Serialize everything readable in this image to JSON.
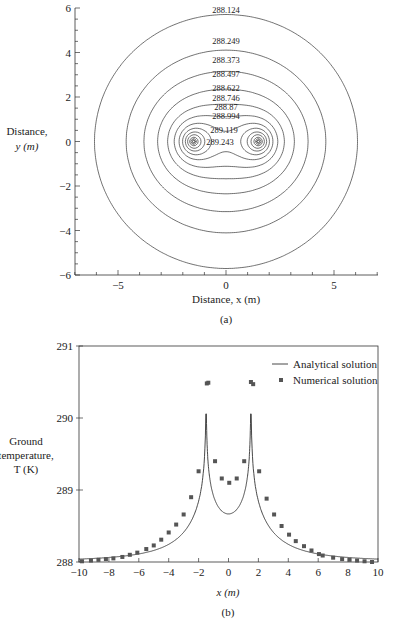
{
  "chart_data": [
    {
      "type": "contour",
      "caption": "(a)",
      "xlabel": "Distance, x (m)",
      "ylabel_line1": "Distance,",
      "ylabel_line2": "y (m)",
      "xlim": [
        -7,
        7
      ],
      "ylim": [
        -6,
        6
      ],
      "xticks": [
        -5,
        0,
        5
      ],
      "xtick_labels": [
        "−5",
        "0",
        "5"
      ],
      "yticks": [
        6,
        4,
        2,
        0,
        -2,
        -4,
        -6
      ],
      "ytick_labels": [
        "6",
        "4",
        "2",
        "0",
        "−2",
        "−4",
        "−6"
      ],
      "heat_sources_x": [
        -1.5,
        1.5
      ],
      "contour_levels": [
        288.124,
        288.249,
        288.373,
        288.497,
        288.622,
        288.746,
        288.87,
        288.994,
        289.119,
        289.243
      ],
      "contour_labels": [
        "288.124",
        "288.249",
        "288.373",
        "288.497",
        "288.622",
        "288.746",
        "288.87",
        "288.994",
        "289.119",
        "289.243"
      ]
    },
    {
      "type": "line",
      "caption": "(b)",
      "xlabel": "x (m)",
      "ylabel_line1": "Ground",
      "ylabel_line2": "temperature,",
      "ylabel_line3": "T (K)",
      "xlim": [
        -10,
        10
      ],
      "ylim": [
        288,
        291
      ],
      "xticks": [
        -10,
        -8,
        -6,
        -4,
        -2,
        0,
        2,
        4,
        6,
        8,
        10
      ],
      "xtick_labels": [
        "−10",
        "−8",
        "−6",
        "−4",
        "−2",
        "0",
        "2",
        "4",
        "6",
        "8",
        "10"
      ],
      "yticks": [
        288,
        289,
        290,
        291
      ],
      "ytick_labels": [
        "288",
        "289",
        "290",
        "291"
      ],
      "legend": {
        "position": "upper right",
        "entries": [
          "Analytical solution",
          "Numerical solution"
        ]
      },
      "series": [
        {
          "name": "Numerical solution",
          "marker": "square",
          "x": [
            -9.8,
            -9.2,
            -8.7,
            -8.2,
            -7.7,
            -7.1,
            -6.6,
            -6.1,
            -5.5,
            -5.0,
            -4.5,
            -4.0,
            -3.5,
            -3.0,
            -2.5,
            -2.0,
            -1.45,
            -1.35,
            -0.9,
            -0.45,
            0.05,
            0.55,
            1.05,
            1.5,
            1.65,
            2.05,
            2.55,
            3.05,
            3.55,
            4.05,
            4.5,
            5.05,
            5.55,
            6.05,
            6.3,
            7.0,
            7.6,
            8.1,
            8.6,
            9.1,
            9.6
          ],
          "y": [
            288.01,
            288.02,
            288.03,
            288.04,
            288.05,
            288.07,
            288.1,
            288.13,
            288.18,
            288.23,
            288.31,
            288.41,
            288.52,
            288.66,
            288.9,
            289.26,
            290.48,
            290.49,
            289.4,
            289.16,
            289.1,
            289.16,
            289.4,
            290.5,
            290.47,
            289.26,
            288.88,
            288.66,
            288.5,
            288.38,
            288.29,
            288.22,
            288.16,
            288.11,
            288.09,
            288.06,
            288.04,
            288.03,
            288.02,
            288.01,
            288.0
          ]
        },
        {
          "name": "Analytical solution",
          "style": "solid line",
          "note": "singular peaks near x = ±1.5"
        }
      ]
    }
  ]
}
